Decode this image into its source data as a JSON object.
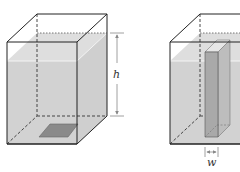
{
  "figures": [
    {
      "id": "tank-with-plate",
      "description": "Rectangular tank partially filled with water, horizontal plate at bottom",
      "labels": {
        "height": "h"
      }
    },
    {
      "id": "tank-with-vertical-plate",
      "description": "Same tank with a vertical plate of width w standing inside",
      "labels": {
        "width": "w"
      }
    }
  ],
  "colors": {
    "water": "#d4d4d4",
    "water_top": "#e2e2e2",
    "plate": "#8a8a8a",
    "vertical_plate_front": "#a9a9a9",
    "vertical_plate_side": "#bdbdbd",
    "edge": "#222222",
    "dimension": "#888888"
  }
}
